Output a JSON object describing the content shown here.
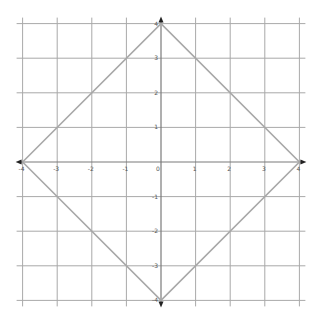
{
  "chart_data": {
    "type": "line",
    "title": "",
    "xlabel": "",
    "ylabel": "",
    "xlim": [
      -4,
      4
    ],
    "ylim": [
      -4,
      4
    ],
    "grid": true,
    "x_ticks": [
      -4,
      -3,
      -2,
      -1,
      0,
      1,
      2,
      3,
      4
    ],
    "y_ticks": [
      -4,
      -3,
      -2,
      -1,
      0,
      1,
      2,
      3,
      4
    ],
    "x_tick_labels": [
      "-4",
      "-3",
      "-2",
      "-1",
      "0",
      "1",
      "2",
      "3",
      "4"
    ],
    "y_tick_labels": [
      "-4",
      "-3",
      "-2",
      "-1",
      "0",
      "1",
      "2",
      "3",
      "4"
    ],
    "series": [
      {
        "name": "diamond |x|+|y|=4",
        "closed": true,
        "points": [
          [
            -4,
            0
          ],
          [
            0,
            4
          ],
          [
            4,
            0
          ],
          [
            0,
            -4
          ],
          [
            -4,
            0
          ]
        ]
      }
    ],
    "axis_arrows": [
      "left",
      "right",
      "up",
      "down"
    ]
  },
  "colors": {
    "grid": "#a9a9a9",
    "axis": "#7a7a7a",
    "shape": "#a8a8a8",
    "labels": "#555555"
  },
  "layout": {
    "origin_px": [
      161,
      162
    ],
    "unit_px": 34.6
  }
}
